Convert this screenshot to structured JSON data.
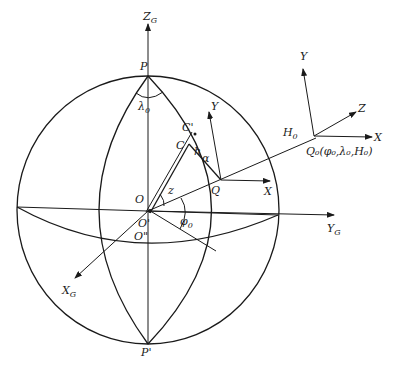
{
  "figure": {
    "colors": {
      "line": "#1a1a1a",
      "background": "#ffffff"
    },
    "labels": {
      "zg": "Z",
      "zg_sub": "G",
      "yg": "Y",
      "yg_sub": "G",
      "xg": "X",
      "xg_sub": "G",
      "p": "P",
      "p_prime": "P'",
      "lambda0": "λ",
      "lambda0_sub": "0",
      "o": "O",
      "o_prime": "O'",
      "o_dprime": "O\"",
      "z": "z",
      "phi0": "φ",
      "phi0_sub": "0",
      "q": "Q",
      "c": "C",
      "c_prime": "C'",
      "h": "h",
      "alpha": "α",
      "local_y": "Y",
      "local_x": "X",
      "h0": "H",
      "h0_sub": "0",
      "q0_label": "Q₀(φ₀,λ₀,H₀)",
      "frame_y": "Y",
      "frame_z": "Z",
      "frame_x": "X"
    }
  }
}
